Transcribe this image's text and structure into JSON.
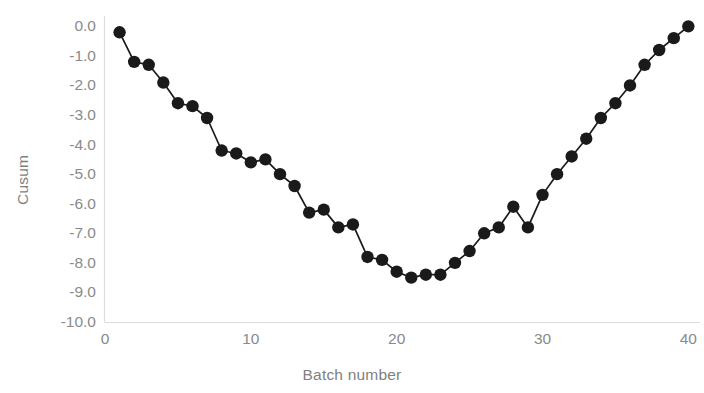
{
  "chart_data": {
    "type": "line",
    "title": "",
    "xlabel": "Batch number",
    "ylabel": "Cusum",
    "xlim": [
      0,
      40.8
    ],
    "ylim": [
      -10.0,
      0.35
    ],
    "xticks": [
      0,
      10,
      20,
      30,
      40
    ],
    "xtick_labels": [
      "0",
      "10",
      "20",
      "30",
      "40"
    ],
    "yticks": [
      0.0,
      -1.0,
      -2.0,
      -3.0,
      -4.0,
      -5.0,
      -6.0,
      -7.0,
      -8.0,
      -9.0,
      -10.0
    ],
    "ytick_labels": [
      "0.0",
      "-1.0",
      "-2.0",
      "-3.0",
      "-4.0",
      "-5.0",
      "-6.0",
      "-7.0",
      "-8.0",
      "-9.0",
      "-10.0"
    ],
    "grid": false,
    "legend": null,
    "marker": "filled-circle",
    "marker_color": "#1a1a1a",
    "line_color": "#1a1a1a",
    "axis_color": "#d9d9d9",
    "tick_label_color": "#8a8a8a",
    "background_color": "#ffffff",
    "x": [
      1,
      2,
      3,
      4,
      5,
      6,
      7,
      8,
      9,
      10,
      11,
      12,
      13,
      14,
      15,
      16,
      17,
      18,
      19,
      20,
      21,
      22,
      23,
      24,
      25,
      26,
      27,
      28,
      29,
      30,
      31,
      32,
      33,
      34,
      35,
      36,
      37,
      38,
      39,
      40
    ],
    "values": [
      -0.2,
      -1.2,
      -1.3,
      -1.9,
      -2.6,
      -2.7,
      -3.1,
      -4.2,
      -4.3,
      -4.6,
      -4.5,
      -5.0,
      -5.4,
      -6.3,
      -6.2,
      -6.8,
      -6.7,
      -7.8,
      -7.9,
      -8.3,
      -8.5,
      -8.4,
      -8.4,
      -8.0,
      -7.6,
      -7.0,
      -6.8,
      -6.1,
      -6.8,
      -5.7,
      -5.0,
      -4.4,
      -3.8,
      -3.1,
      -2.6,
      -2.0,
      -1.3,
      -0.8,
      -0.4,
      0.0
    ],
    "series": [
      {
        "name": "Cusum",
        "values": [
          -0.2,
          -1.2,
          -1.3,
          -1.9,
          -2.6,
          -2.7,
          -3.1,
          -4.2,
          -4.3,
          -4.6,
          -4.5,
          -5.0,
          -5.4,
          -6.3,
          -6.2,
          -6.8,
          -6.7,
          -7.8,
          -7.9,
          -8.3,
          -8.5,
          -8.4,
          -8.4,
          -8.0,
          -7.6,
          -7.0,
          -6.8,
          -6.1,
          -6.8,
          -5.7,
          -5.0,
          -4.4,
          -3.8,
          -3.1,
          -2.6,
          -2.0,
          -1.3,
          -0.8,
          -0.4,
          0.0
        ]
      }
    ]
  }
}
